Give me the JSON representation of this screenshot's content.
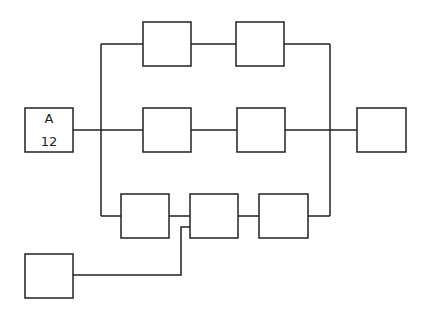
{
  "diagram": {
    "nodes": [
      {
        "id": "A",
        "label": "A",
        "value": "12",
        "x": 25,
        "y": 108,
        "w": 48,
        "h": 44
      },
      {
        "id": "top1",
        "label": "",
        "x": 143,
        "y": 22,
        "w": 48,
        "h": 44
      },
      {
        "id": "top2",
        "label": "",
        "x": 236,
        "y": 22,
        "w": 48,
        "h": 44
      },
      {
        "id": "mid1",
        "label": "",
        "x": 143,
        "y": 108,
        "w": 48,
        "h": 44
      },
      {
        "id": "mid2",
        "label": "",
        "x": 237,
        "y": 108,
        "w": 48,
        "h": 44
      },
      {
        "id": "out",
        "label": "",
        "x": 357,
        "y": 108,
        "w": 49,
        "h": 44
      },
      {
        "id": "bot1",
        "label": "",
        "x": 121,
        "y": 194,
        "w": 48,
        "h": 44
      },
      {
        "id": "bot2",
        "label": "",
        "x": 190,
        "y": 194,
        "w": 48,
        "h": 44
      },
      {
        "id": "bot3",
        "label": "",
        "x": 259,
        "y": 194,
        "w": 49,
        "h": 44
      },
      {
        "id": "src",
        "label": "",
        "x": 25,
        "y": 254,
        "w": 48,
        "h": 44
      }
    ],
    "node_a": {
      "title": "A",
      "value": "12"
    }
  }
}
